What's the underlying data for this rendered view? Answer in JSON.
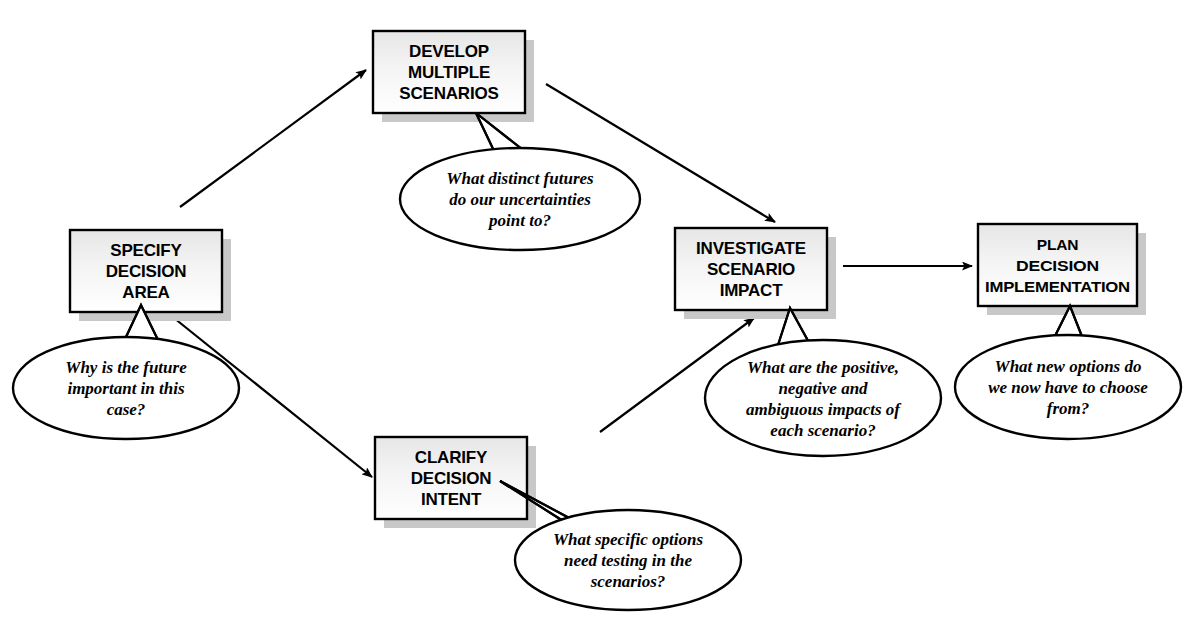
{
  "diagram": {
    "type": "process-flow",
    "background_color": "#ffffff",
    "box_fill_color": "#ffffff",
    "box_border_color": "#000000",
    "box_shadow_color": "#c8c8c8",
    "arrow_color": "#000000"
  },
  "boxes": [
    {
      "id": "specify-decision-area",
      "lines": [
        "SPECIFY",
        "DECISION",
        "AREA"
      ],
      "x": 70,
      "y": 230,
      "w": 152,
      "h": 82
    },
    {
      "id": "develop-multiple-scenarios",
      "lines": [
        "DEVELOP",
        "MULTIPLE",
        "SCENARIOS"
      ],
      "x": 373,
      "y": 31,
      "w": 152,
      "h": 82
    },
    {
      "id": "clarify-decision-intent",
      "lines": [
        "CLARIFY",
        "DECISION",
        "INTENT"
      ],
      "x": 375,
      "y": 437,
      "w": 152,
      "h": 82
    },
    {
      "id": "investigate-scenario-impact",
      "lines": [
        "INVESTIGATE",
        "SCENARIO",
        "IMPACT"
      ],
      "x": 675,
      "y": 228,
      "w": 152,
      "h": 82
    },
    {
      "id": "plan-decision-implementation",
      "lines": [
        "PLAN",
        "DECISION",
        "IMPLEMENTATION"
      ],
      "x": 978,
      "y": 224,
      "w": 159,
      "h": 82
    }
  ],
  "callouts": [
    {
      "id": "callout-specify-decision-area",
      "lines": [
        "Why is the future",
        "important in this",
        "case?"
      ],
      "cx": 126,
      "cy": 388,
      "rx": 113,
      "ry": 51,
      "tail": "M 126 337 L 141 305 L 158 340 Z"
    },
    {
      "id": "callout-develop-multiple-scenarios",
      "lines": [
        "What distinct futures",
        "do our uncertainties",
        "point to?"
      ],
      "cx": 520,
      "cy": 199,
      "rx": 120,
      "ry": 51,
      "tail": "M 495 153 L 476 113 L 523 150 Z"
    },
    {
      "id": "callout-clarify-decision-intent",
      "lines": [
        "What specific options",
        "need testing in the",
        "scenarios?"
      ],
      "cx": 628,
      "cy": 560,
      "rx": 113,
      "ry": 50,
      "tail": "M 560 519 L 500 481 L 588 528 Z"
    },
    {
      "id": "callout-investigate-scenario-impact",
      "lines": [
        "What are the positive,",
        "negative and",
        "ambiguous impacts of",
        "each scenario?"
      ],
      "cx": 823,
      "cy": 398,
      "rx": 118,
      "ry": 58,
      "tail": "M 778 345 L 790 308 L 812 348 Z"
    },
    {
      "id": "callout-plan-decision-implementation",
      "lines": [
        "What new options do",
        "we now have to choose",
        "from?"
      ],
      "cx": 1068,
      "cy": 387,
      "rx": 113,
      "ry": 52,
      "tail": "M 1053 340 L 1070 306 L 1083 339 Z"
    }
  ],
  "arrows": [
    {
      "id": "arrow-specify-to-develop",
      "from": "specify-decision-area",
      "to": "develop-multiple-scenarios",
      "path": "M 180 207 L 366 70"
    },
    {
      "id": "arrow-develop-to-investigate",
      "from": "develop-multiple-scenarios",
      "to": "investigate-scenario-impact",
      "path": "M 546 84 L 775 222"
    },
    {
      "id": "arrow-specify-to-clarify",
      "from": "specify-decision-area",
      "to": "clarify-decision-intent",
      "path": "M 174 318 L 372 477"
    },
    {
      "id": "arrow-clarify-to-investigate",
      "from": "clarify-decision-intent",
      "to": "investigate-scenario-impact",
      "path": "M 600 432 L 754 318"
    },
    {
      "id": "arrow-investigate-to-plan",
      "from": "investigate-scenario-impact",
      "to": "plan-decision-implementation",
      "path": "M 843 266 L 972 266"
    }
  ]
}
